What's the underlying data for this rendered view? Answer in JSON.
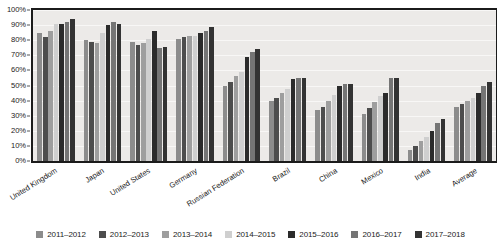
{
  "chart_data": {
    "type": "bar",
    "title": "",
    "xlabel": "",
    "ylabel": "",
    "ylim": [
      0,
      100
    ],
    "grid": true,
    "legend_position": "bottom",
    "y_ticks": [
      "0%",
      "10%",
      "20%",
      "30%",
      "40%",
      "50%",
      "60%",
      "70%",
      "80%",
      "90%",
      "100%"
    ],
    "categories": [
      "United Kingdom",
      "Japan",
      "United States",
      "Germany",
      "Russian Federation",
      "Brazil",
      "China",
      "Mexico",
      "India",
      "Average"
    ],
    "series": [
      {
        "name": "2011–2012",
        "color": "#8c8c8c",
        "values": [
          85,
          80,
          79,
          81,
          50,
          40,
          34,
          31,
          7,
          36
        ]
      },
      {
        "name": "2012–2013",
        "color": "#4d4d4d",
        "values": [
          82,
          79,
          77,
          82,
          52,
          42,
          36,
          35,
          10,
          38
        ]
      },
      {
        "name": "2013–2014",
        "color": "#9e9e9e",
        "values": [
          86,
          78,
          78,
          83,
          56,
          45,
          40,
          39,
          13,
          40
        ]
      },
      {
        "name": "2014–2015",
        "color": "#cfcfcf",
        "values": [
          91,
          85,
          81,
          83,
          59,
          48,
          44,
          43,
          16,
          42
        ]
      },
      {
        "name": "2015–2016",
        "color": "#2b2b2b",
        "values": [
          91,
          90,
          86,
          85,
          69,
          54,
          50,
          45,
          20,
          45
        ]
      },
      {
        "name": "2016–2017",
        "color": "#757575",
        "values": [
          92,
          92,
          75,
          86,
          72,
          55,
          51,
          55,
          25,
          50
        ]
      },
      {
        "name": "2017–2018",
        "color": "#333333",
        "values": [
          94,
          91,
          75.5,
          89,
          74,
          55,
          51,
          55,
          28,
          52
        ]
      }
    ]
  },
  "axes": {
    "plot_background": "#eceae8",
    "axis_color": "#1b1b1b",
    "gridline_color": "#f8f7f6"
  }
}
